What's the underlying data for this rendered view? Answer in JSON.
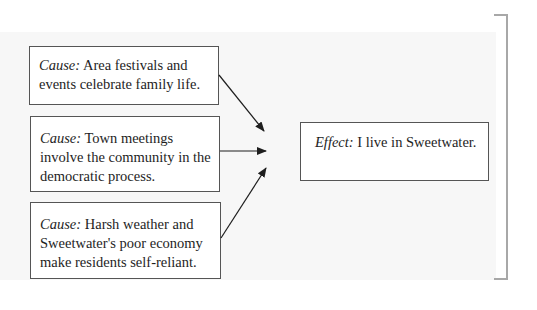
{
  "diagram": {
    "causes": [
      {
        "label": "Cause:",
        "text": " Area festivals and events celebrate family life."
      },
      {
        "label": "Cause:",
        "text": " Town meetings involve the community in the democratic process."
      },
      {
        "label": "Cause:",
        "text": " Harsh weather and Sweetwater's poor economy make residents self-reliant."
      }
    ],
    "effect": {
      "label": "Effect:",
      "text": " I live in Sweetwater."
    },
    "colors": {
      "panel": "#f7f7f7",
      "box_border": "#555555",
      "arrow": "#1e1e1e",
      "bracket": "#a8a8a8"
    }
  }
}
